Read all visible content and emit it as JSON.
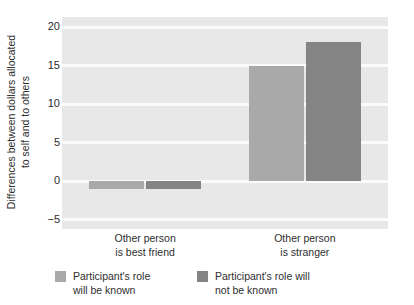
{
  "chart_data": {
    "type": "bar",
    "title": "",
    "subtitle": "",
    "xlabel": "",
    "ylabel_line1": "Differences between dollars allocated",
    "ylabel_line2": "to self and to others",
    "categories": [
      "Other person is best friend",
      "Other person is stranger"
    ],
    "category_lines": [
      [
        "Other person",
        "is best friend"
      ],
      [
        "Other person",
        "is stranger"
      ]
    ],
    "series": [
      {
        "name": "Participant's role will be known",
        "name_lines": [
          "Participant's role",
          "will be known"
        ],
        "color": "#a9a9a9",
        "values": [
          -1,
          15
        ]
      },
      {
        "name": "Participant's role will not be known",
        "name_lines": [
          "Participant's role will",
          "not be known"
        ],
        "color": "#848484",
        "values": [
          -1,
          18
        ]
      }
    ],
    "ylim": [
      -6.2,
      21.3
    ],
    "yticks": [
      20,
      15,
      10,
      5,
      0,
      -5
    ],
    "ytick_labels": [
      "20",
      "15",
      "10",
      "5",
      "0",
      "−5"
    ],
    "grid": true,
    "grid_color": "#fbfbfb",
    "plot_background": "#e8e8e8",
    "legend_position": "bottom"
  },
  "legend": {
    "items": [
      {
        "swatch_name": "legend-swatch-role-known",
        "line1": "Participant's role",
        "line2": "will be known"
      },
      {
        "swatch_name": "legend-swatch-role-not-known",
        "line1": "Participant's role will",
        "line2": "not be known"
      }
    ]
  }
}
